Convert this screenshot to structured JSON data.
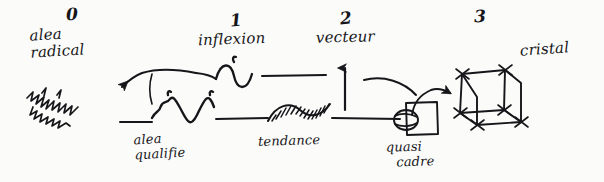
{
  "figure": {
    "ink_color": "#16161a",
    "background_color": "#fbfbf9",
    "width": 604,
    "height": 182
  },
  "stages": [
    {
      "number": "0",
      "name_line1": "alea",
      "name_line2": "radical",
      "glyph": "chaotic-scribble"
    },
    {
      "number": "1",
      "name_line1": "inflexion",
      "name_line2": "",
      "glyph": "s-curve-inflection"
    },
    {
      "number": "2",
      "name_line1": "vecteur",
      "name_line2": "",
      "glyph": "up-arrow"
    },
    {
      "number": "3",
      "name_line1": "cristal",
      "name_line2": "",
      "glyph": "cube-lattice"
    }
  ],
  "parts": [
    {
      "label_line1": "alea",
      "label_line2": "qualifie",
      "glyph": "wiggly-noise-segment"
    },
    {
      "label_line1": "tendance",
      "label_line2": "",
      "glyph": "helix-spiral"
    },
    {
      "label_line1": "quasi",
      "label_line2": "cadre",
      "glyph": "square-with-ball"
    }
  ]
}
